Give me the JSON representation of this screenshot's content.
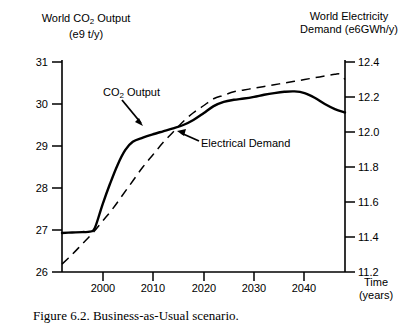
{
  "figure": {
    "caption": "Figure 6.2. Business-as-Usual scenario."
  },
  "axes": {
    "left_title_line1_pre": "World CO",
    "left_title_line1_sub": "2",
    "left_title_line1_post": " Output",
    "left_title_line2": "(e9 t/y)",
    "right_title_line1": "World Electricity",
    "right_title_line2": "Demand (e6GWh/y)",
    "x_title_line1": "Time",
    "x_title_line2": "(years)",
    "left_ticks": [
      "31",
      "30",
      "29",
      "28",
      "27",
      "26"
    ],
    "right_ticks": [
      "12.4",
      "12.2",
      "12.0",
      "11.8",
      "11.6",
      "11.4",
      "11.2"
    ],
    "x_ticks": [
      "2000",
      "2010",
      "2020",
      "2030",
      "2040"
    ]
  },
  "annotations": {
    "co2_label_pre": "CO",
    "co2_label_sub": "2",
    "co2_label_post": " Output",
    "electrical_label": "Electrical Demand"
  },
  "colors": {
    "ink": "#000000",
    "background": "#ffffff"
  },
  "chart_data": {
    "type": "line",
    "title": "Figure 6.2. Business-as-Usual scenario.",
    "xlabel": "Time (years)",
    "ylabel": "World CO2 Output (e9 t/y)",
    "y2label": "World Electricity Demand (e6GWh/y)",
    "xlim": [
      1992,
      2048
    ],
    "ylim": [
      26,
      31
    ],
    "y2lim": [
      11.2,
      12.4
    ],
    "xticks": [
      2000,
      2010,
      2020,
      2030,
      2040
    ],
    "yticks": [
      26,
      27,
      28,
      29,
      30,
      31
    ],
    "y2ticks": [
      11.2,
      11.4,
      11.6,
      11.8,
      12.0,
      12.2,
      12.4
    ],
    "grid": false,
    "legend": "inline-annotations",
    "series": [
      {
        "name": "CO2 Output",
        "axis": "left",
        "style": "solid",
        "x": [
          1992,
          1994,
          1996,
          1997.5,
          1998.5,
          2000,
          2001.5,
          2003,
          2004.5,
          2006,
          2008,
          2010,
          2012,
          2014,
          2016,
          2018,
          2020,
          2022,
          2024,
          2026,
          2028,
          2030,
          2032,
          2034,
          2036,
          2038,
          2040,
          2042,
          2044,
          2046,
          2048
        ],
        "y": [
          26.93,
          26.94,
          26.95,
          26.96,
          27.05,
          27.6,
          28.1,
          28.55,
          28.9,
          29.1,
          29.2,
          29.28,
          29.35,
          29.42,
          29.5,
          29.62,
          29.78,
          29.95,
          30.05,
          30.1,
          30.13,
          30.17,
          30.22,
          30.26,
          30.29,
          30.3,
          30.26,
          30.15,
          30.0,
          29.88,
          29.8
        ]
      },
      {
        "name": "Electrical Demand",
        "axis": "right",
        "style": "dashed",
        "x": [
          1992,
          1994,
          1996,
          1998,
          2000,
          2002,
          2004,
          2006,
          2008,
          2010,
          2012,
          2014,
          2016,
          2018,
          2020,
          2022,
          2024,
          2026,
          2028,
          2030,
          2032,
          2034,
          2036,
          2038,
          2040,
          2042,
          2044,
          2046,
          2047,
          2048
        ],
        "y": [
          11.245,
          11.3,
          11.36,
          11.42,
          11.49,
          11.56,
          11.64,
          11.72,
          11.8,
          11.87,
          11.94,
          12.0,
          12.06,
          12.11,
          12.15,
          12.19,
          12.21,
          12.23,
          12.24,
          12.25,
          12.26,
          12.27,
          12.28,
          12.29,
          12.3,
          12.31,
          12.32,
          12.33,
          12.33,
          12.3
        ]
      }
    ]
  }
}
